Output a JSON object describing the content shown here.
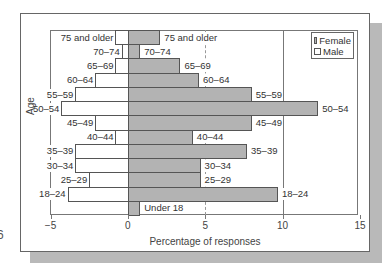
{
  "page_artifact": "6",
  "chart_data": {
    "type": "bar",
    "orientation": "horizontal",
    "title": "",
    "xlabel": "Percentage of responses",
    "ylabel": "Age",
    "xlim": [
      -5,
      15
    ],
    "xticks": [
      -5,
      0,
      5,
      10,
      15
    ],
    "xtick_labels": [
      "−5",
      "0",
      "5",
      "10",
      "15"
    ],
    "grid": {
      "x_major": [
        0,
        10
      ],
      "x_dashed": [
        5
      ]
    },
    "legend": {
      "position": "upper right",
      "entries": [
        "Female",
        "Male"
      ]
    },
    "colors": {
      "Female": "#b3b3b3",
      "Male": "#ffffff"
    },
    "categories": [
      "75 and older",
      "70–74",
      "65–69",
      "60–64",
      "55–59",
      "50–54",
      "45–49",
      "40–44",
      "35–39",
      "30–34",
      "25–29",
      "18–24",
      "Under 18"
    ],
    "series": [
      {
        "name": "Female",
        "direction": "positive",
        "values": [
          2.1,
          0.8,
          3.4,
          4.6,
          8.0,
          12.3,
          8.0,
          4.2,
          7.7,
          4.7,
          4.7,
          9.7,
          0.8
        ]
      },
      {
        "name": "Male",
        "direction": "negative",
        "values": [
          0.8,
          0.4,
          0.8,
          2.1,
          3.4,
          4.3,
          2.1,
          0.8,
          3.4,
          3.4,
          2.5,
          3.9,
          0.0
        ]
      }
    ]
  },
  "legend": {
    "female_label": "Female",
    "male_label": "Male"
  },
  "axis": {
    "x_title": "Percentage of responses",
    "y_title": "Age"
  }
}
